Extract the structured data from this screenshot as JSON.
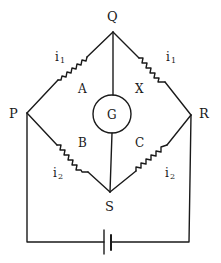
{
  "diagram": {
    "type": "Wheatstone bridge circuit",
    "nodes": {
      "Q": {
        "label": "Q"
      },
      "P": {
        "label": "P"
      },
      "R": {
        "label": "R"
      },
      "S": {
        "label": "S"
      }
    },
    "resistors": {
      "A": {
        "label": "A",
        "between": [
          "P",
          "Q"
        ],
        "current": "i",
        "current_sub": "1"
      },
      "X": {
        "label": "X",
        "between": [
          "Q",
          "R"
        ],
        "current": "i",
        "current_sub": "1"
      },
      "B": {
        "label": "B",
        "between": [
          "P",
          "S"
        ],
        "current": "i",
        "current_sub": "2"
      },
      "C": {
        "label": "C",
        "between": [
          "S",
          "R"
        ],
        "current": "i",
        "current_sub": "2"
      }
    },
    "galvanometer": {
      "label": "G",
      "between": [
        "Q",
        "S"
      ]
    },
    "battery": {
      "between": [
        "P",
        "R"
      ]
    },
    "colors": {
      "ink": "#1a1a1a",
      "background": "#ffffff"
    }
  }
}
